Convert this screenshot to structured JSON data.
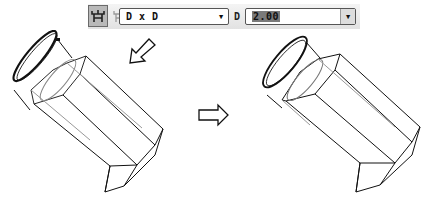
{
  "toolbar": {
    "buttons": [
      {
        "icon": "fork-both-icon",
        "active": true
      },
      {
        "icon": "fork-single-icon",
        "active": false
      }
    ],
    "type_select": {
      "value": "D x D"
    },
    "d_label": "D",
    "d_input": {
      "value": "2.00"
    }
  },
  "arrows": {
    "down_left": "arrow-down-left-icon",
    "right": "arrow-right-icon"
  },
  "colors": {
    "stroke": "#111111",
    "active_button": "#b9b9b9"
  }
}
